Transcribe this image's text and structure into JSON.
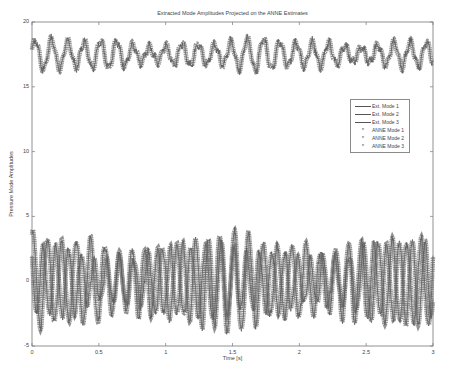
{
  "chart_data": {
    "type": "line",
    "title": "Extracted Mode Amplitudes Projected on the ANNE Estimates",
    "xlabel": "Time [s]",
    "ylabel": "Pressure Mode Amplitudes",
    "xlim": [
      0,
      3
    ],
    "ylim": [
      -5,
      20
    ],
    "xticks": [
      "0",
      "0.5",
      "1",
      "1.5",
      "2",
      "2.5",
      "3"
    ],
    "yticks": [
      "-5",
      "0",
      "5",
      "10",
      "15",
      "20"
    ],
    "grid": false,
    "legend_position": "right-upper-inside",
    "legend": [
      "Ext. Mode 1",
      "Ext. Mode 2",
      "Ext. Mode 3",
      "ANNE Mode 1",
      "ANNE Mode 2",
      "ANNE Mode 3"
    ],
    "series": [
      {
        "name": "Ext. Mode 1",
        "style": "line",
        "description": "oscillation around ~17.5, range ~15.8 to ~18.9, ~8 Hz"
      },
      {
        "name": "Ext. Mode 2",
        "style": "line",
        "description": "oscillation around ~0, range ~-3.5 to ~3.8, ~9 Hz"
      },
      {
        "name": "Ext. Mode 3",
        "style": "line",
        "description": "oscillation around ~0, range ~-3.5 to ~3.5, ~10 Hz"
      },
      {
        "name": "ANNE Mode 1",
        "style": "marker *",
        "description": "overlays Ext. Mode 1"
      },
      {
        "name": "ANNE Mode 2",
        "style": "marker *",
        "description": "overlays Ext. Mode 2"
      },
      {
        "name": "ANNE Mode 3",
        "style": "marker *",
        "description": "overlays Ext. Mode 3"
      }
    ],
    "mode1": {
      "mean": 17.5,
      "amp": 0.9,
      "freq_hz": 8.2,
      "min": 15.8,
      "max": 18.9
    },
    "mode2": {
      "mean": 0.0,
      "amp": 2.8,
      "freq_hz": 9.3,
      "min": -3.5,
      "max": 3.8
    },
    "mode3": {
      "mean": 0.0,
      "amp": 2.5,
      "freq_hz": 10.5,
      "min": -3.5,
      "max": 3.5
    }
  },
  "colors": {
    "line": "#5a5a5a",
    "marker": "#6e6e6e",
    "axis": "#777777",
    "text": "#444444"
  }
}
